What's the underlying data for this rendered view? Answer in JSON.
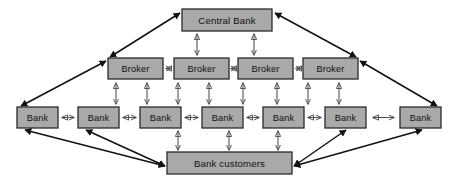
{
  "diagram": {
    "background_color": "#ffffff",
    "node_fill_color": "#a9a9a9",
    "node_border_color": "#2a2a2a",
    "thin_arrow_color": "#555555",
    "thick_arrow_color": "#111111",
    "levels": [
      {
        "id": "central",
        "label_key": "central_bank",
        "nodes": [
          {
            "name": "central-bank",
            "label": "Central Bank",
            "x": 182,
            "y": 9,
            "w": 90,
            "h": 22
          }
        ]
      },
      {
        "id": "brokers",
        "nodes": [
          {
            "name": "broker-1",
            "label": "Broker",
            "x": 108,
            "y": 58,
            "w": 55,
            "h": 21
          },
          {
            "name": "broker-2",
            "label": "Broker",
            "x": 174,
            "y": 58,
            "w": 55,
            "h": 21
          },
          {
            "name": "broker-3",
            "label": "Broker",
            "x": 238,
            "y": 58,
            "w": 55,
            "h": 21
          },
          {
            "name": "broker-4",
            "label": "Broker",
            "x": 303,
            "y": 58,
            "w": 55,
            "h": 21
          }
        ]
      },
      {
        "id": "banks",
        "nodes": [
          {
            "name": "bank-1",
            "label": "Bank",
            "x": 17,
            "y": 107,
            "w": 41,
            "h": 21
          },
          {
            "name": "bank-2",
            "label": "Bank",
            "x": 78,
            "y": 107,
            "w": 41,
            "h": 21
          },
          {
            "name": "bank-3",
            "label": "Bank",
            "x": 140,
            "y": 107,
            "w": 41,
            "h": 21
          },
          {
            "name": "bank-4",
            "label": "Bank",
            "x": 202,
            "y": 107,
            "w": 41,
            "h": 21
          },
          {
            "name": "bank-5",
            "label": "Bank",
            "x": 263,
            "y": 107,
            "w": 41,
            "h": 21
          },
          {
            "name": "bank-6",
            "label": "Bank",
            "x": 325,
            "y": 107,
            "w": 41,
            "h": 21
          },
          {
            "name": "bank-7",
            "label": "Bank",
            "x": 400,
            "y": 107,
            "w": 41,
            "h": 21
          }
        ]
      },
      {
        "id": "customers",
        "nodes": [
          {
            "name": "bank-customers",
            "label": "Bank customers",
            "x": 167,
            "y": 152,
            "w": 125,
            "h": 22
          }
        ]
      }
    ],
    "labels": {
      "central_bank": "Central Bank",
      "broker": "Broker",
      "bank": "Bank",
      "bank_customers": "Bank customers"
    },
    "vertical_links_central_to_broker": [
      {
        "name": "link-central-broker-2",
        "x": 197,
        "y1": 33,
        "y2": 56
      },
      {
        "name": "link-central-broker-3",
        "x": 254,
        "y1": 33,
        "y2": 56
      }
    ],
    "vertical_links_broker_to_bank": [
      {
        "name": "link-broker1-bank2",
        "x": 116,
        "y1": 81,
        "y2": 105
      },
      {
        "name": "link-broker1-bank3",
        "x": 147,
        "y1": 81,
        "y2": 105
      },
      {
        "name": "link-broker2-bank3",
        "x": 178,
        "y1": 81,
        "y2": 105
      },
      {
        "name": "link-broker2-bank4",
        "x": 209,
        "y1": 81,
        "y2": 105
      },
      {
        "name": "link-broker3-bank4",
        "x": 243,
        "y1": 81,
        "y2": 105
      },
      {
        "name": "link-broker3-bank5",
        "x": 277,
        "y1": 81,
        "y2": 105
      },
      {
        "name": "link-broker4-bank5",
        "x": 308,
        "y1": 81,
        "y2": 105
      },
      {
        "name": "link-broker4-bank6",
        "x": 339,
        "y1": 81,
        "y2": 105
      }
    ],
    "vertical_links_bank_to_customers": [
      {
        "name": "link-bank3-customers",
        "x": 178,
        "y1": 130,
        "y2": 150
      },
      {
        "name": "link-bank4-customers",
        "x": 229,
        "y1": 130,
        "y2": 150
      },
      {
        "name": "link-bank5-customers",
        "x": 278,
        "y1": 130,
        "y2": 150
      }
    ],
    "horizontal_links_brokers": [
      {
        "name": "link-broker1-broker2",
        "x1": 165,
        "x2": 172,
        "y": 68
      },
      {
        "name": "link-broker2-broker3",
        "x1": 231,
        "x2": 236,
        "y": 68
      },
      {
        "name": "link-broker3-broker4",
        "x1": 295,
        "x2": 301,
        "y": 68
      }
    ],
    "horizontal_links_banks": [
      {
        "name": "link-bank1-bank2",
        "x1": 60,
        "x2": 76,
        "y": 117
      },
      {
        "name": "link-bank2-bank3",
        "x1": 121,
        "x2": 138,
        "y": 117
      },
      {
        "name": "link-bank3-bank4",
        "x1": 183,
        "x2": 200,
        "y": 117
      },
      {
        "name": "link-bank4-bank5",
        "x1": 245,
        "x2": 261,
        "y": 117
      },
      {
        "name": "link-bank5-bank6",
        "x1": 306,
        "x2": 323,
        "y": 117
      },
      {
        "name": "link-bank6-bank7",
        "x1": 368,
        "x2": 398,
        "y": 117
      }
    ],
    "diagonal_links": [
      {
        "name": "link-broker1-central",
        "x1": 110,
        "y1": 57,
        "x2": 180,
        "y2": 13
      },
      {
        "name": "link-broker4-central",
        "x1": 356,
        "y1": 57,
        "x2": 275,
        "y2": 13
      },
      {
        "name": "link-bank1-broker1",
        "x1": 21,
        "y1": 106,
        "x2": 106,
        "y2": 61
      },
      {
        "name": "link-bank7-broker4",
        "x1": 437,
        "y1": 106,
        "x2": 360,
        "y2": 61
      },
      {
        "name": "link-bank1-customers",
        "x1": 25,
        "y1": 130,
        "x2": 165,
        "y2": 166
      },
      {
        "name": "link-bank2-customers",
        "x1": 86,
        "y1": 130,
        "x2": 165,
        "y2": 166
      },
      {
        "name": "link-bank6-customers",
        "x1": 346,
        "y1": 130,
        "x2": 294,
        "y2": 166
      },
      {
        "name": "link-bank7-customers",
        "x1": 422,
        "y1": 130,
        "x2": 294,
        "y2": 166
      }
    ]
  }
}
